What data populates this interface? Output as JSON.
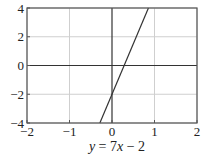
{
  "chart_data": {
    "type": "line",
    "title": "",
    "caption": "y = 7x − 2",
    "caption_parts": {
      "y": "y",
      "eq": " = 7",
      "x": "x",
      "rest": " − 2"
    },
    "xlabel": "",
    "ylabel": "",
    "xlim": [
      -2,
      2
    ],
    "ylim": [
      -4,
      4
    ],
    "xticks": [
      -2,
      -1,
      0,
      1,
      2
    ],
    "xtick_labels": [
      "−2",
      "−1",
      "0",
      "1",
      "2"
    ],
    "yticks": [
      -4,
      -2,
      0,
      2,
      4
    ],
    "ytick_labels": [
      "−4",
      "−2",
      "0",
      "2",
      "4"
    ],
    "grid": true,
    "legend": null,
    "series": [
      {
        "name": "y = 7x − 2",
        "slope": 7,
        "intercept": -2,
        "x": [
          -0.2857,
          0.8571
        ],
        "y": [
          -4,
          4
        ],
        "color": "#333333"
      }
    ]
  },
  "colors": {
    "grid": "#cfcfcf",
    "axis": "#333333",
    "frame": "#555555",
    "line": "#333333"
  }
}
